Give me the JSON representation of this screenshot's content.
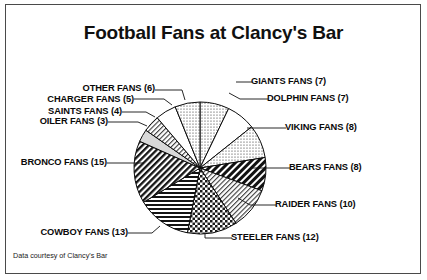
{
  "title": "Football Fans at Clancy's Bar",
  "credit": "Data courtesy of Clancy's Bar",
  "labels": {
    "other": "OTHER FANS (6)",
    "charger": "CHARGER FANS (5)",
    "saints": "SAINTS FANS (4)",
    "oiler": "OILER FANS (3)",
    "bronco": "BRONCO FANS (15)",
    "cowboy": "COWBOY FANS (13)",
    "steeler": "STEELER FANS (12)",
    "raider": "RAIDER FANS (10)",
    "bears": "BEARS FANS (8)",
    "viking": "VIKING FANS (8)",
    "dolphin": "DOLPHIN FANS (7)",
    "giants": "GIANTS FANS (7)"
  },
  "chart_data": {
    "type": "pie",
    "title": "Football Fans at Clancy's Bar",
    "total": 108,
    "start_angle_deg": 0,
    "direction": "clockwise",
    "legend": "none (direct labels with leader lines)",
    "categories": [
      "GIANTS FANS",
      "DOLPHIN FANS",
      "VIKING FANS",
      "BEARS FANS",
      "RAIDER FANS",
      "STEELER FANS",
      "COWBOY FANS",
      "BRONCO FANS",
      "OILER FANS",
      "SAINTS FANS",
      "CHARGER FANS",
      "OTHER FANS"
    ],
    "values": [
      7,
      7,
      8,
      8,
      10,
      12,
      13,
      15,
      3,
      4,
      5,
      6
    ],
    "slices": [
      {
        "label": "GIANTS FANS (7)",
        "name": "GIANTS FANS",
        "value": 7,
        "pattern": "fine-dots"
      },
      {
        "label": "DOLPHIN FANS (7)",
        "name": "DOLPHIN FANS",
        "value": 7,
        "pattern": "white"
      },
      {
        "label": "VIKING FANS (8)",
        "name": "VIKING FANS",
        "value": 8,
        "pattern": "fine-dots"
      },
      {
        "label": "BEARS FANS (8)",
        "name": "BEARS FANS",
        "value": 8,
        "pattern": "heavy-diagonal"
      },
      {
        "label": "RAIDER FANS (10)",
        "name": "RAIDER FANS",
        "value": 10,
        "pattern": "light-diagonal"
      },
      {
        "label": "STEELER FANS (12)",
        "name": "STEELER FANS",
        "value": 12,
        "pattern": "checkerboard"
      },
      {
        "label": "COWBOY FANS (13)",
        "name": "COWBOY FANS",
        "value": 13,
        "pattern": "horizontal-lines"
      },
      {
        "label": "BRONCO FANS (15)",
        "name": "BRONCO FANS",
        "value": 15,
        "pattern": "bold-diagonal"
      },
      {
        "label": "OILER FANS (3)",
        "name": "OILER FANS",
        "value": 3,
        "pattern": "light-gray"
      },
      {
        "label": "SAINTS FANS (4)",
        "name": "SAINTS FANS",
        "value": 4,
        "pattern": "light-diagonal"
      },
      {
        "label": "CHARGER FANS (5)",
        "name": "CHARGER FANS",
        "value": 5,
        "pattern": "white"
      },
      {
        "label": "OTHER FANS (6)",
        "name": "OTHER FANS",
        "value": 6,
        "pattern": "fine-dots"
      }
    ]
  }
}
